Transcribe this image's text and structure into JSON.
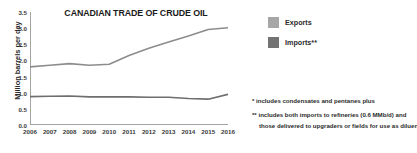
{
  "chart_data": {
    "type": "line",
    "title": "CANADIAN TRADE OF CRUDE OIL",
    "xlabel": "",
    "ylabel": "Million barrels per day",
    "grid": false,
    "legend_position": "right",
    "xlim": [
      2006,
      2016
    ],
    "ylim": [
      0.0,
      3.5
    ],
    "ytick_labels": [
      "0.0",
      "0.5",
      "1.0",
      "1.5",
      "2.0",
      "2.5",
      "3.0",
      "3.5"
    ],
    "ytick_values": [
      0.0,
      0.5,
      1.0,
      1.5,
      2.0,
      2.5,
      3.0,
      3.5
    ],
    "categories": [
      2006,
      2007,
      2008,
      2009,
      2010,
      2011,
      2012,
      2013,
      2014,
      2015,
      2016
    ],
    "xtick_labels": [
      "2006",
      "2007",
      "2008",
      "2009",
      "2010",
      "2011",
      "2012",
      "2013",
      "2014",
      "2015",
      "2016"
    ],
    "series": [
      {
        "name": "Exports",
        "color": "#8c8c8c",
        "values": [
          1.8,
          1.85,
          1.9,
          1.85,
          1.88,
          2.15,
          2.38,
          2.57,
          2.76,
          2.96,
          3.01
        ]
      },
      {
        "name": "Imports**",
        "color": "#6e6e6e",
        "values": [
          0.88,
          0.89,
          0.9,
          0.87,
          0.87,
          0.87,
          0.86,
          0.86,
          0.82,
          0.8,
          0.95
        ]
      }
    ]
  },
  "legend": {
    "items": [
      {
        "label": "Exports",
        "color": "#a6a6a6"
      },
      {
        "label": "Imports**",
        "color": "#737373"
      }
    ]
  },
  "footnotes": [
    "* includes condensates and pentanes plus",
    "** includes both imports to refineries (0.6 MMb/d) and",
    "those delivered to upgraders or fields for use as diluent"
  ],
  "colors": {
    "background": "#ffffff",
    "axis": "#9a9a9a",
    "text": "#2b2b2b",
    "exports_line": "#8c8c8c",
    "imports_line": "#6e6e6e"
  }
}
